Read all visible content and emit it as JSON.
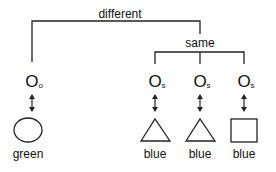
{
  "diagram": {
    "top_label": "different",
    "group_label": "same",
    "nodes": [
      {
        "symbol": "O",
        "subscript": "o",
        "shape": "circle",
        "color_label": "green"
      },
      {
        "symbol": "O",
        "subscript": "s",
        "shape": "triangle",
        "color_label": "blue"
      },
      {
        "symbol": "O",
        "subscript": "s",
        "shape": "triangle",
        "color_label": "blue"
      },
      {
        "symbol": "O",
        "subscript": "s",
        "shape": "square",
        "color_label": "blue"
      }
    ]
  }
}
